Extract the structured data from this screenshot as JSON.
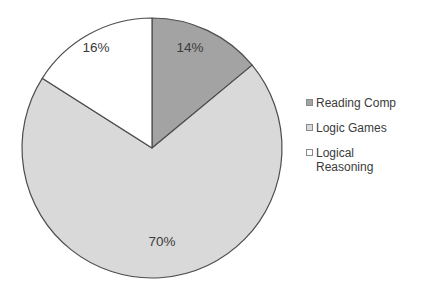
{
  "chart_data": {
    "type": "pie",
    "title": "",
    "categories": [
      "Reading Comp",
      "Logic Games",
      "Logical Reasoning"
    ],
    "values": [
      14,
      70,
      16
    ],
    "value_labels": [
      "14%",
      "70%",
      "16%"
    ],
    "units": "percent",
    "total": 100,
    "start_angle_deg": 0,
    "direction": "clockwise",
    "legend": {
      "position": "right",
      "entries": [
        {
          "label": "Reading Comp",
          "color": "#a3a3a3",
          "value": 14,
          "value_label": "14%"
        },
        {
          "label": "Logic Games",
          "color": "#d9d9d9",
          "value": 70,
          "value_label": "70%"
        },
        {
          "label": "Logical\nReasoning",
          "color": "#ffffff",
          "value": 16,
          "value_label": "16%"
        }
      ]
    },
    "slices": [
      {
        "name": "Reading Comp",
        "value": 14,
        "value_label": "14%",
        "color": "#a3a3a3",
        "stroke": "#4d4d4d",
        "label_x": 190,
        "label_y": 48
      },
      {
        "name": "Logic Games",
        "value": 70,
        "value_label": "70%",
        "color": "#d9d9d9",
        "stroke": "#4d4d4d",
        "label_x": 162,
        "label_y": 242
      },
      {
        "name": "Logical Reasoning",
        "value": 16,
        "value_label": "16%",
        "color": "#ffffff",
        "stroke": "#4d4d4d",
        "label_x": 96,
        "label_y": 48
      }
    ],
    "geometry": {
      "cx": 152,
      "cy": 148,
      "r": 130
    },
    "label_color": "#3b3b3b",
    "background": "#ffffff",
    "grid": false,
    "xlabel": "",
    "ylabel": ""
  }
}
